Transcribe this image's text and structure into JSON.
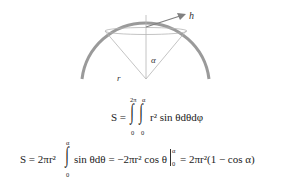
{
  "diagram": {
    "labels": {
      "h": "h",
      "alpha": "α",
      "r": "r"
    },
    "colors": {
      "arc": "#9a9a9a",
      "lines": "#b5b5b5",
      "arrow": "#808080"
    }
  },
  "equation1": {
    "lhs": "S =",
    "outer_upper": "2π",
    "outer_lower": "0",
    "inner_upper": "α",
    "inner_lower": "0",
    "integrand": "r² sin θdθdφ"
  },
  "equation2": {
    "part1": "S = 2πr²",
    "int_upper": "α",
    "int_lower": "0",
    "part2": "sin θdθ = −2πr² cos θ",
    "eval_upper": "α",
    "eval_lower": "0",
    "part3": "= 2πr²(1 − cos α)"
  }
}
